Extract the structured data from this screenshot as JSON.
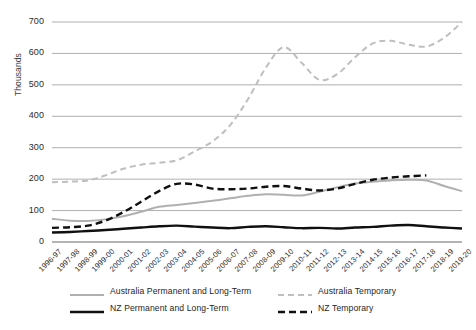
{
  "chart_data": {
    "type": "line",
    "title": "",
    "xlabel": "",
    "ylabel": "Thousands",
    "ylim": [
      0,
      700
    ],
    "ytick_step": 100,
    "grid": true,
    "grid_axis": "y",
    "legend_position": "bottom",
    "yticks": [
      "0",
      "100",
      "200",
      "300",
      "400",
      "500",
      "600",
      "700"
    ],
    "categories": [
      "1996-97",
      "1997-98",
      "1998-99",
      "1999-00",
      "2000-01",
      "2001-02",
      "2002-03",
      "2003-04",
      "2004-05",
      "2005-06",
      "2006-07",
      "2007-08",
      "2008-09",
      "2009-10",
      "2010-11",
      "2011-12",
      "2012-13",
      "2013-14",
      "2014-15",
      "2015-16",
      "2016-17",
      "2017-18",
      "2018-19",
      "2019-20"
    ],
    "series": [
      {
        "name": "Australia Permanent and Long-Term",
        "color": "#b0b0b0",
        "style": "solid",
        "width": 2,
        "values": [
          74,
          68,
          67,
          72,
          82,
          96,
          112,
          118,
          124,
          131,
          139,
          147,
          152,
          150,
          148,
          160,
          174,
          186,
          192,
          196,
          198,
          196,
          178,
          162
        ]
      },
      {
        "name": "Australia Temporary",
        "color": "#bfbfbf",
        "style": "dashed",
        "width": 2,
        "values": [
          190,
          192,
          196,
          212,
          233,
          246,
          252,
          260,
          288,
          320,
          372,
          455,
          555,
          620,
          570,
          516,
          534,
          588,
          632,
          640,
          628,
          622,
          650,
          700
        ]
      },
      {
        "name": "NZ Permanent and Long-Term",
        "color": "#101010",
        "style": "solid",
        "width": 2.4,
        "values": [
          30,
          32,
          35,
          38,
          42,
          46,
          50,
          52,
          49,
          46,
          44,
          48,
          50,
          47,
          44,
          45,
          43,
          46,
          48,
          52,
          54,
          50,
          46,
          43
        ]
      },
      {
        "name": "NZ Temporary",
        "color": "#101010",
        "style": "dashed",
        "width": 2.4,
        "values": [
          45,
          47,
          52,
          68,
          95,
          128,
          162,
          185,
          183,
          170,
          168,
          170,
          176,
          178,
          170,
          164,
          170,
          185,
          198,
          205,
          209,
          212,
          null,
          null
        ]
      }
    ]
  },
  "legend": {
    "items": [
      {
        "label": "Australia Permanent and Long-Term",
        "series": 0
      },
      {
        "label": "Australia Temporary",
        "series": 1
      },
      {
        "label": "NZ Permanent and Long-Term",
        "series": 2
      },
      {
        "label": "NZ Temporary",
        "series": 3
      }
    ]
  }
}
